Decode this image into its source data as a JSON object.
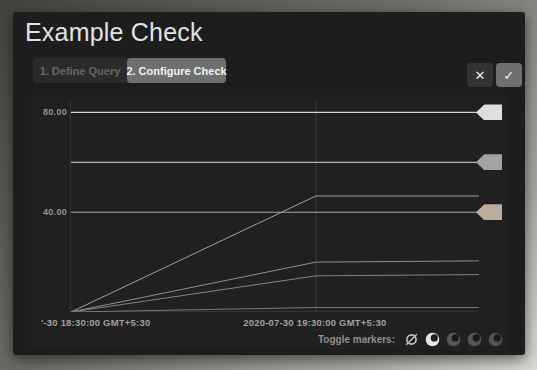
{
  "window": {
    "title": "Example Check"
  },
  "steps": {
    "step1_label": "1. Define Query",
    "step2_label": "2. Configure Check",
    "active_step": "2. Configure Check"
  },
  "actions": {
    "close_icon_glyph": "✕",
    "confirm_icon_glyph": "✓"
  },
  "chart_data": {
    "type": "line",
    "title": "",
    "xlabel": "",
    "ylabel": "",
    "ylim": [
      0,
      85
    ],
    "grid": true,
    "yticks": [
      {
        "value": 80,
        "label": "80.00"
      },
      {
        "value": 40,
        "label": "40.00"
      }
    ],
    "xticks": [
      {
        "frac": 0.0,
        "label": "'-30 18:30:00 GMT+5:30",
        "align": "left"
      },
      {
        "frac": 0.6,
        "label": "2020-07-30 19:30:00 GMT+5:30",
        "align": "center"
      }
    ],
    "thresholds": [
      {
        "value": 80,
        "line_color": "#d2d2d2",
        "handle_color": "#dedede"
      },
      {
        "value": 60,
        "line_color": "#b4b4b4",
        "handle_color": "#a2a2a2"
      },
      {
        "value": 40,
        "line_color": "#9b9b9b",
        "handle_color": "#b9ad9b"
      }
    ],
    "series": [
      {
        "name": "series-1",
        "color": "#9e9e9e",
        "points": [
          [
            0,
            0
          ],
          [
            0.6,
            46.5
          ],
          [
            1,
            46.5
          ]
        ]
      },
      {
        "name": "series-2",
        "color": "#8f8f8f",
        "points": [
          [
            0,
            0
          ],
          [
            0.6,
            20.0
          ],
          [
            1,
            20.5
          ]
        ]
      },
      {
        "name": "series-3",
        "color": "#848484",
        "points": [
          [
            0,
            0
          ],
          [
            0.6,
            14.5
          ],
          [
            1,
            15.0
          ]
        ]
      },
      {
        "name": "series-4",
        "color": "#787878",
        "points": [
          [
            0,
            0
          ],
          [
            0.6,
            1.8
          ],
          [
            1,
            1.8
          ]
        ]
      }
    ],
    "gridline_color": "#474747",
    "vgridline_color": "#3a3a3a"
  },
  "footer": {
    "toggle_markers_label": "Toggle markers:",
    "icons": [
      {
        "kind": "eye-off",
        "color": "#c4c4c4",
        "active": true
      },
      {
        "kind": "eye",
        "color": "#e6e6e6",
        "pupil": "#1f1f1f",
        "active": true
      },
      {
        "kind": "eye",
        "color": "#575757",
        "pupil": "#1a1a1a",
        "active": false
      },
      {
        "kind": "eye",
        "color": "#555555",
        "pupil": "#1a1a1a",
        "active": false
      },
      {
        "kind": "eye",
        "color": "#525252",
        "pupil": "#1a1a1a",
        "active": false
      }
    ]
  }
}
